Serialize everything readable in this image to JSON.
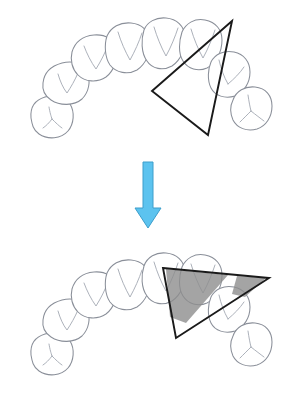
{
  "figure": {
    "background_color": "#ffffff",
    "width": 294,
    "height": 402,
    "panels": [
      {
        "id": "panel-before",
        "label": "upper-arch-before",
        "description": "Occlusal view of a dental arch with an outlined triangle overlay positioned on the right posterior segment, not aligned with the teeth"
      },
      {
        "id": "panel-after",
        "label": "lower-arch-after",
        "description": "Occlusal view of a dental arch with the triangle rotated and repositioned, showing two shaded grey overlap regions where the triangle covers the teeth"
      }
    ]
  },
  "colors": {
    "tooth_outline": "#8a8f99",
    "tooth_groove": "#a8adb6",
    "tooth_fill": "#ffffff",
    "triangle_stroke": "#1a1a1a",
    "overlap_fill": "#8d8d8d",
    "arrow_fill": "#5cc3ef",
    "arrow_stroke": "#3c9ecb",
    "background": "#ffffff"
  },
  "arrow": {
    "name": "transition-arrow",
    "direction": "down",
    "color": "#5cc3ef",
    "x_center": 148,
    "y_start": 162,
    "y_end": 228
  },
  "shapes": {
    "triangle_before": {
      "name": "triangle-overlay-before",
      "filled": false,
      "vertices": [
        [
          232,
          21
        ],
        [
          152,
          91
        ],
        [
          208,
          135
        ]
      ]
    },
    "triangle_after": {
      "name": "triangle-overlay-after",
      "filled": false,
      "vertices": [
        [
          163,
          268
        ],
        [
          269,
          278
        ],
        [
          176,
          338
        ]
      ]
    },
    "overlap_left": {
      "name": "overlap-region-left",
      "vertices": [
        [
          166,
          269
        ],
        [
          228,
          275
        ],
        [
          186,
          323
        ],
        [
          170,
          317
        ]
      ]
    },
    "overlap_right": {
      "name": "overlap-region-right",
      "vertices": [
        [
          237,
          276
        ],
        [
          266,
          278
        ],
        [
          245,
          297
        ],
        [
          232,
          294
        ]
      ]
    }
  },
  "arch_before": {
    "name": "dental-arch-before",
    "tooth_count": 9,
    "teeth": [
      {
        "name": "tooth-upper-left-molar",
        "type": "molar"
      },
      {
        "name": "tooth-upper-left-premolar",
        "type": "premolar"
      },
      {
        "name": "tooth-upper-left-canine",
        "type": "canine"
      },
      {
        "name": "tooth-upper-left-lateral-incisor",
        "type": "incisor"
      },
      {
        "name": "tooth-upper-left-central-incisor",
        "type": "incisor"
      },
      {
        "name": "tooth-upper-right-central-incisor",
        "type": "incisor"
      },
      {
        "name": "tooth-upper-right-lateral-incisor",
        "type": "incisor"
      },
      {
        "name": "tooth-upper-right-canine",
        "type": "canine"
      },
      {
        "name": "tooth-upper-right-molar",
        "type": "molar"
      }
    ]
  },
  "arch_after": {
    "name": "dental-arch-after",
    "tooth_count": 9,
    "teeth": [
      {
        "name": "tooth-lower-left-molar",
        "type": "molar"
      },
      {
        "name": "tooth-lower-left-premolar",
        "type": "premolar"
      },
      {
        "name": "tooth-lower-left-canine",
        "type": "canine"
      },
      {
        "name": "tooth-lower-left-lateral-incisor",
        "type": "incisor"
      },
      {
        "name": "tooth-lower-left-central-incisor",
        "type": "incisor"
      },
      {
        "name": "tooth-lower-right-central-incisor",
        "type": "incisor"
      },
      {
        "name": "tooth-lower-right-lateral-incisor",
        "type": "incisor"
      },
      {
        "name": "tooth-lower-right-canine",
        "type": "canine"
      },
      {
        "name": "tooth-lower-right-molar",
        "type": "molar"
      }
    ]
  }
}
